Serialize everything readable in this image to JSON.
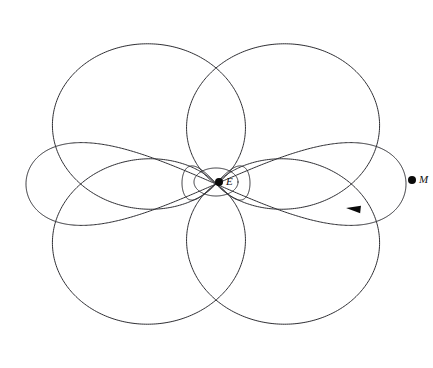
{
  "figure": {
    "kind": "orbit-diagram",
    "width": 433,
    "height": 368,
    "background_color": "#ffffff",
    "stroke_color": "#2e2e33",
    "stroke_width": 1,
    "marker_color": "#0a0a0a"
  },
  "chart_data": {
    "type": "line",
    "subtitle": "",
    "xlabel": "",
    "ylabel": "",
    "grid": false,
    "legend_position": "none",
    "axis_visible": false,
    "tick_labels": [],
    "annotations": [
      {
        "text": "E",
        "role": "central-body-label",
        "x": 227,
        "y": 182
      },
      {
        "text": "M",
        "role": "orbiting-body-label",
        "x": 419,
        "y": 180
      }
    ],
    "series": [
      {
        "name": "rosette-orbit",
        "type": "parametric-rose",
        "center": [
          216,
          184
        ],
        "radial_amplitude_max": 188,
        "radial_amplitude_min": 14,
        "petal_count": 4,
        "description": "Four-lobed precessing ellipse traced by M about focus E",
        "samples": 1400
      }
    ]
  },
  "curves": {
    "big_lobes": {
      "name": "large-orbit-lobes",
      "center_x": 216,
      "center_y": 184,
      "count": 4,
      "angles_deg": [
        45,
        135,
        225,
        315
      ],
      "outer_radius_x": 196,
      "outer_radius_y": 168,
      "lobe_half_width_deg": 44,
      "description": "Four broad outer lobes filling the corners of the frame"
    },
    "figure_eight": {
      "name": "horizontal-figure-eight",
      "center_x": 216,
      "center_y": 184,
      "span_x": 190,
      "span_y": 45,
      "description": "Wide flattened lemniscate crossing through the centre"
    },
    "inner_ellipse": {
      "name": "inner-central-ellipse",
      "center_x": 216,
      "center_y": 182,
      "radius_x": 22,
      "radius_y": 14,
      "rotation_deg": 0,
      "description": "Tight ellipse immediately around the central body E"
    },
    "inner_lens": {
      "name": "inner-lens-loop",
      "center_x": 216,
      "center_y": 183,
      "radius_x": 34,
      "radius_y": 19,
      "description": "Lens-shaped loop just outside the central ellipse"
    }
  },
  "bodies": [
    {
      "id": "central-body",
      "label": "E",
      "x": 219,
      "y": 182,
      "radius": 4,
      "label_dx": 7,
      "label_dy": -6,
      "role": "central attracting body"
    },
    {
      "id": "orbiting-body",
      "label": "M",
      "x": 412,
      "y": 180,
      "radius": 4,
      "label_dx": 7,
      "label_dy": -6,
      "role": "orbiting satellite"
    }
  ],
  "markers": [
    {
      "id": "direction-arrow",
      "type": "arrow-head",
      "x": 355,
      "y": 209,
      "angle_deg": 186,
      "size": 9,
      "label": "",
      "description": "Arrowhead showing direction of travel along the orbit"
    }
  ]
}
